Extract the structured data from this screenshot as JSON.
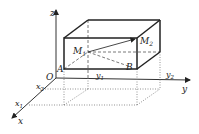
{
  "diagram": {
    "type": "3d-coordinate-box",
    "axes": {
      "x": "x",
      "y": "y",
      "z": "z",
      "origin": "O"
    },
    "points": {
      "M1": "M",
      "M1_sub": "1",
      "M2": "M",
      "M2_sub": "2",
      "A": "A",
      "B": "B"
    },
    "ticks": {
      "x1": "x",
      "x1_sub": "1",
      "x2": "x",
      "x2_sub": "2",
      "y1": "y",
      "y1_sub": "1",
      "y2": "y",
      "y2_sub": "2"
    },
    "colors": {
      "line": "#333333",
      "box": "#222222",
      "dashed": "#555555",
      "dotted": "#777777"
    }
  }
}
